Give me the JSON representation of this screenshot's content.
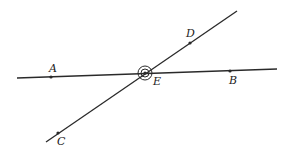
{
  "diagram": {
    "title": "",
    "stroke_color": "#2a2a2a",
    "lines": [
      {
        "name": "line-AB",
        "x1": 17,
        "y1": 78,
        "x2": 277,
        "y2": 69
      },
      {
        "name": "line-CD",
        "x1": 46,
        "y1": 142,
        "x2": 237,
        "y2": 11
      }
    ],
    "points": {
      "A": {
        "label": "A",
        "x": 51,
        "y": 77,
        "lx": 49,
        "ly": 72
      },
      "B": {
        "label": "B",
        "x": 230,
        "y": 71,
        "lx": 229,
        "ly": 84
      },
      "C": {
        "label": "C",
        "x": 58,
        "y": 133,
        "lx": 57,
        "ly": 145
      },
      "D": {
        "label": "D",
        "x": 190,
        "y": 43,
        "lx": 186,
        "ly": 37
      },
      "E": {
        "label": "E",
        "x": 145,
        "y": 73,
        "lx": 153,
        "ly": 85
      }
    },
    "angle_marks": {
      "center": "E",
      "inner_radius": 4,
      "outer_radius": 7
    }
  }
}
